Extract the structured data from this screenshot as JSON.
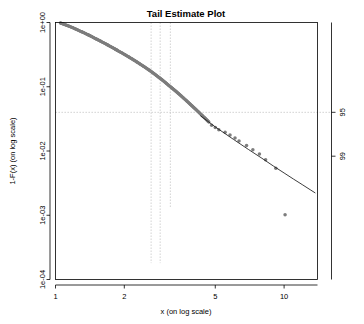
{
  "chart_data": {
    "type": "scatter",
    "title": "Tail Estimate Plot",
    "xlabel": "x (on log scale)",
    "ylabel": "1-F(x) (on log scale)",
    "xscale": "log",
    "yscale": "log",
    "xlim": [
      1,
      14
    ],
    "ylim": [
      0.0001,
      1
    ],
    "grid": false,
    "legend": null,
    "x_ticks": [
      {
        "value": 1,
        "label": "1"
      },
      {
        "value": 2,
        "label": "2"
      },
      {
        "value": 5,
        "label": "5"
      },
      {
        "value": 10,
        "label": "10"
      }
    ],
    "y_ticks": [
      {
        "value": 1,
        "label": "1e+00"
      },
      {
        "value": 0.1,
        "label": "1e-01"
      },
      {
        "value": 0.01,
        "label": "1e-02"
      },
      {
        "value": 0.001,
        "label": "1e-03"
      },
      {
        "value": 0.0001,
        "label": "1e-04"
      }
    ],
    "right_axis_ticks": [
      {
        "value": 0.04,
        "label": "95"
      },
      {
        "value": 0.0083,
        "label": "99"
      }
    ],
    "annotations": {
      "vertical_reference_lines": [
        {
          "x": 2.62,
          "style": "dotted",
          "color": "#b9b9b9",
          "y_from": 0.00018,
          "y_to": 1.0
        },
        {
          "x": 2.87,
          "style": "dotted",
          "color": "#b9b9b9",
          "y_from": 0.00018,
          "y_to": 1.0
        },
        {
          "x": 3.18,
          "style": "dotted",
          "color": "#b9b9b9",
          "y_from": 0.0013,
          "y_to": 1.0
        }
      ],
      "horizontal_reference_lines": [
        {
          "y": 0.04,
          "style": "dashed",
          "color": "#b9b9b9"
        }
      ]
    },
    "series": [
      {
        "name": "empirical tail (dense cloud)",
        "type": "scatter",
        "color": "#7d7d7d",
        "marker": "circle",
        "points": [
          [
            1.05,
            0.985
          ],
          [
            1.07,
            0.962
          ],
          [
            1.09,
            0.94
          ],
          [
            1.11,
            0.915
          ],
          [
            1.14,
            0.884
          ],
          [
            1.17,
            0.852
          ],
          [
            1.2,
            0.82
          ],
          [
            1.23,
            0.788
          ],
          [
            1.26,
            0.757
          ],
          [
            1.3,
            0.72
          ],
          [
            1.34,
            0.686
          ],
          [
            1.38,
            0.652
          ],
          [
            1.42,
            0.62
          ],
          [
            1.46,
            0.59
          ],
          [
            1.5,
            0.56
          ],
          [
            1.55,
            0.528
          ],
          [
            1.6,
            0.498
          ],
          [
            1.65,
            0.47
          ],
          [
            1.7,
            0.444
          ],
          [
            1.75,
            0.419
          ],
          [
            1.8,
            0.396
          ],
          [
            1.86,
            0.371
          ],
          [
            1.92,
            0.348
          ],
          [
            1.98,
            0.327
          ],
          [
            2.04,
            0.307
          ],
          [
            2.1,
            0.289
          ],
          [
            2.16,
            0.272
          ],
          [
            2.22,
            0.256
          ],
          [
            2.28,
            0.241
          ],
          [
            2.34,
            0.227
          ],
          [
            2.4,
            0.214
          ],
          [
            2.47,
            0.2
          ],
          [
            2.54,
            0.187
          ],
          [
            2.61,
            0.175
          ],
          [
            2.68,
            0.163
          ],
          [
            2.75,
            0.152
          ],
          [
            2.82,
            0.142
          ],
          [
            2.89,
            0.133
          ],
          [
            2.96,
            0.124
          ],
          [
            3.03,
            0.116
          ],
          [
            3.1,
            0.108
          ],
          [
            3.18,
            0.1005
          ],
          [
            3.26,
            0.0935
          ],
          [
            3.34,
            0.087
          ],
          [
            3.42,
            0.0808
          ],
          [
            3.5,
            0.0752
          ],
          [
            3.58,
            0.07
          ],
          [
            3.66,
            0.0652
          ],
          [
            3.74,
            0.0608
          ],
          [
            3.82,
            0.0567
          ],
          [
            3.9,
            0.0529
          ],
          [
            3.99,
            0.0491
          ],
          [
            4.08,
            0.0456
          ],
          [
            4.17,
            0.0424
          ],
          [
            4.26,
            0.0394
          ],
          [
            4.35,
            0.0367
          ],
          [
            4.44,
            0.0342
          ],
          [
            4.53,
            0.032
          ],
          [
            4.62,
            0.0298
          ],
          [
            4.71,
            0.0278
          ]
        ]
      },
      {
        "name": "empirical tail (discrete upper points)",
        "type": "scatter",
        "color": "#7d7d7d",
        "marker": "circle",
        "points": [
          [
            4.82,
            0.0252
          ],
          [
            5.0,
            0.0233
          ],
          [
            5.18,
            0.0215
          ],
          [
            5.52,
            0.0196
          ],
          [
            5.8,
            0.0178
          ],
          [
            6.1,
            0.016
          ],
          [
            6.35,
            0.0143
          ],
          [
            6.85,
            0.0122
          ],
          [
            7.3,
            0.0105
          ],
          [
            7.8,
            0.009
          ],
          [
            8.3,
            0.0073
          ],
          [
            9.2,
            0.0054
          ],
          [
            10.1,
            0.00102
          ]
        ]
      },
      {
        "name": "fitted GPD tail estimate",
        "type": "line",
        "color": "#1a1a1a",
        "points": [
          [
            4.3,
            0.0355
          ],
          [
            5.0,
            0.0237
          ],
          [
            6.0,
            0.0152
          ],
          [
            7.0,
            0.0105
          ],
          [
            8.0,
            0.0077
          ],
          [
            9.0,
            0.0058
          ],
          [
            10.0,
            0.00455
          ],
          [
            11.0,
            0.00365
          ],
          [
            12.0,
            0.003
          ],
          [
            13.0,
            0.0025
          ],
          [
            13.7,
            0.00222
          ]
        ]
      }
    ]
  }
}
